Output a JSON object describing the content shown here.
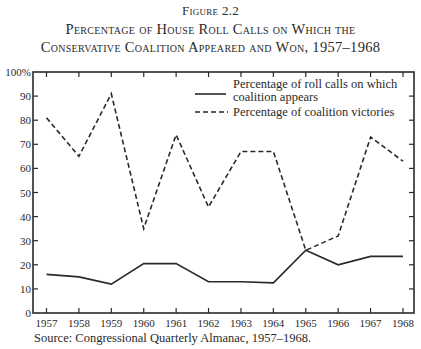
{
  "figure": {
    "number": "Figure 2.2",
    "title_line_1": "Percentage of House Roll Calls on Which the",
    "title_line_2": "Conservative Coalition Appeared and Won, 1957–1968",
    "source": "Source: Congressional Quarterly Almanac, 1957–1968."
  },
  "colors": {
    "ink": "#2a2a2a",
    "background": "#ffffff"
  },
  "chart_data": {
    "type": "line",
    "xlabel": "",
    "ylabel": "",
    "x": [
      1957,
      1958,
      1959,
      1960,
      1961,
      1962,
      1963,
      1964,
      1965,
      1966,
      1967,
      1968
    ],
    "categories": [
      "1957",
      "1958",
      "1959",
      "1960",
      "1961",
      "1962",
      "1963",
      "1964",
      "1965",
      "1966",
      "1967",
      "1968"
    ],
    "ylim": [
      0,
      100
    ],
    "yticks": [
      0,
      10,
      20,
      30,
      40,
      50,
      60,
      70,
      80,
      90,
      100
    ],
    "ytick_labels": [
      "0",
      "10",
      "20",
      "30",
      "40",
      "50",
      "60",
      "70",
      "80",
      "90",
      "100%"
    ],
    "grid": false,
    "legend_position": "upper right (inside)",
    "series": [
      {
        "name": "Percentage of roll calls on which coalition appears",
        "legend_lines": [
          "Percentage of roll calls on which",
          "coalition appears"
        ],
        "style": "solid",
        "values": [
          16,
          15,
          12,
          20.5,
          20.5,
          13,
          13,
          12.5,
          26,
          20,
          23.5,
          23.5
        ]
      },
      {
        "name": "Percentage of coalition victories",
        "legend_lines": [
          "Percentage of coalition victories"
        ],
        "style": "dashed",
        "values": [
          81,
          65,
          91,
          35,
          74,
          44,
          67,
          67,
          26,
          32,
          73,
          63
        ]
      }
    ],
    "source": "Congressional Quarterly Almanac, 1957–1968"
  }
}
